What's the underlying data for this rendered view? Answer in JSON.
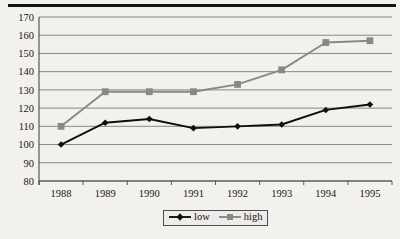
{
  "figure": {
    "background_color": "#f2f1ee",
    "top_rule_color": "#15130f"
  },
  "legend": {
    "position": "bottom-center",
    "border_color": "#4f4d49",
    "entries": [
      {
        "label": "low",
        "marker": "diamond-marker",
        "color": "#100e0b"
      },
      {
        "label": "high",
        "marker": "square-marker",
        "color": "#8a8884"
      }
    ]
  },
  "chart_data": {
    "type": "line",
    "title": "",
    "xlabel": "",
    "ylabel": "",
    "categories": [
      "1988",
      "1989",
      "1990",
      "1991",
      "1992",
      "1993",
      "1994",
      "1995"
    ],
    "x": [
      1988,
      1989,
      1990,
      1991,
      1992,
      1993,
      1994,
      1995
    ],
    "ylim": [
      80,
      170
    ],
    "yticks": [
      80,
      90,
      100,
      110,
      120,
      130,
      140,
      150,
      160,
      170
    ],
    "ytick_labels": [
      "80",
      "90",
      "100",
      "110",
      "120",
      "130",
      "140",
      "150",
      "160",
      "170"
    ],
    "grid": true,
    "grid_axis": "y",
    "legend_position": "bottom-center",
    "series": [
      {
        "name": "low",
        "color": "#100e0b",
        "marker": "diamond",
        "values": [
          100,
          112,
          114,
          109,
          110,
          111,
          119,
          122
        ]
      },
      {
        "name": "high",
        "color": "#8a8884",
        "marker": "square",
        "values": [
          110,
          129,
          129,
          129,
          133,
          141,
          156,
          157
        ]
      }
    ]
  }
}
